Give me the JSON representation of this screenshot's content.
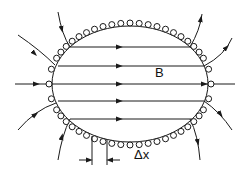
{
  "diagram": {
    "labels": {
      "field": "B",
      "spacing": "Δx"
    },
    "colors": {
      "stroke": "#1a1a1a",
      "background": "#ffffff"
    }
  }
}
